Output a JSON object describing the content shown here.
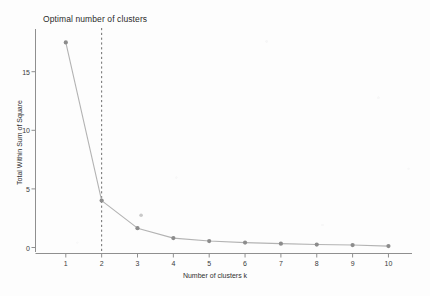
{
  "chart_data": {
    "type": "line",
    "title": "Optimal number of clusters",
    "xlabel": "Number of clusters k",
    "ylabel": "Total Within Sum of Square",
    "x": [
      1,
      2,
      3,
      4,
      5,
      6,
      7,
      8,
      9,
      10
    ],
    "values": [
      17.5,
      4.0,
      1.65,
      0.8,
      0.55,
      0.42,
      0.33,
      0.25,
      0.21,
      0.12
    ],
    "series": [
      {
        "name": "Total Within Sum of Square",
        "values": [
          17.5,
          4.0,
          1.65,
          0.8,
          0.55,
          0.42,
          0.33,
          0.25,
          0.21,
          0.12
        ]
      }
    ],
    "xticks": [
      1,
      2,
      3,
      4,
      5,
      6,
      7,
      8,
      9,
      10
    ],
    "xtick_labels": [
      "1",
      "2",
      "3",
      "4",
      "5",
      "6",
      "7",
      "8",
      "9",
      "10"
    ],
    "yticks": [
      0,
      5,
      10,
      15
    ],
    "ytick_labels": [
      "0",
      "5",
      "10",
      "15"
    ],
    "xlim": [
      0.5,
      10.5
    ],
    "ylim": [
      0,
      18.6
    ],
    "grid": false,
    "legend": false,
    "legend_position": "none",
    "annotations": [
      {
        "name": "optimal-k-vline",
        "type": "vertical-dashed-line",
        "x": 2,
        "label": ""
      },
      {
        "name": "stray-marker-artifact",
        "type": "point",
        "x": 3.1,
        "y": 2.75
      }
    ],
    "style": {
      "line_color": "#b3b3b3",
      "marker_color": "#8c8c8c",
      "axis_color": "#8f8f8f",
      "text_color": "#2f2f2f",
      "background": "#fdfdfd",
      "vline_color": "#6e6e6e",
      "marker_size": 2.1,
      "line_width": 1.0
    }
  }
}
